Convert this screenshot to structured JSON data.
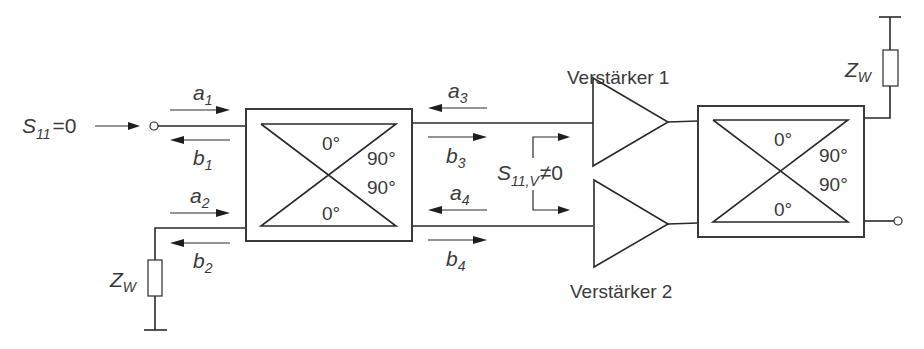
{
  "diagram": {
    "type": "balanced amplifier with 90° hybrid couplers",
    "input": {
      "reflection_label": {
        "main": "S",
        "sub": "11",
        "rest": "=0"
      }
    },
    "wave_labels": {
      "a1": {
        "main": "a",
        "sub": "1"
      },
      "b1": {
        "main": "b",
        "sub": "1"
      },
      "a2": {
        "main": "a",
        "sub": "2"
      },
      "b2": {
        "main": "b",
        "sub": "2"
      },
      "a3": {
        "main": "a",
        "sub": "3"
      },
      "b3": {
        "main": "b",
        "sub": "3"
      },
      "a4": {
        "main": "a",
        "sub": "4"
      },
      "b4": {
        "main": "b",
        "sub": "4"
      }
    },
    "amplifier_reflection": {
      "main": "S",
      "sub": "11,V",
      "rest": "≠0"
    },
    "coupler_left": {
      "phase_top": "0°",
      "phase_right_top": "90°",
      "phase_right_bottom": "90°",
      "phase_bottom": "0°"
    },
    "coupler_right": {
      "phase_top": "0°",
      "phase_right_top": "90°",
      "phase_right_bottom": "90°",
      "phase_bottom": "0°"
    },
    "amplifiers": {
      "top": "Verstärker 1",
      "bottom": "Verstärker 2"
    },
    "terminations": {
      "left": {
        "main": "Z",
        "sub": "W"
      },
      "right": {
        "main": "Z",
        "sub": "W"
      }
    }
  }
}
